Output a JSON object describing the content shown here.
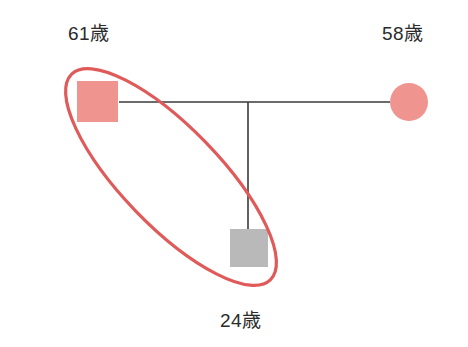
{
  "diagram": {
    "type": "pedigree-chart",
    "background_color": "#ffffff",
    "colors": {
      "affected_fill": "#f0948f",
      "unaffected_fill": "#b9b9b9",
      "line": "#3a3a3a",
      "highlight_ellipse": "#e05a5a",
      "text": "#2b2b2b"
    },
    "individuals": [
      {
        "id": "father",
        "shape": "square",
        "sex": "male",
        "fill": "#f0948f",
        "age_label": "61歳",
        "highlighted": true
      },
      {
        "id": "mother",
        "shape": "circle",
        "sex": "female",
        "fill": "#f0948f",
        "age_label": "58歳",
        "highlighted": false
      },
      {
        "id": "child",
        "shape": "square",
        "sex": "male",
        "fill": "#b9b9b9",
        "age_label": "24歳",
        "highlighted": true
      }
    ],
    "relationships": [
      {
        "type": "partnership",
        "from": "father",
        "to": "mother"
      },
      {
        "type": "descent",
        "from": "partnership",
        "to": "child"
      }
    ],
    "annotation": {
      "type": "ellipse",
      "stroke_color": "#e05a5a",
      "stroke_width": 3,
      "encircles": [
        "father",
        "child"
      ]
    }
  }
}
